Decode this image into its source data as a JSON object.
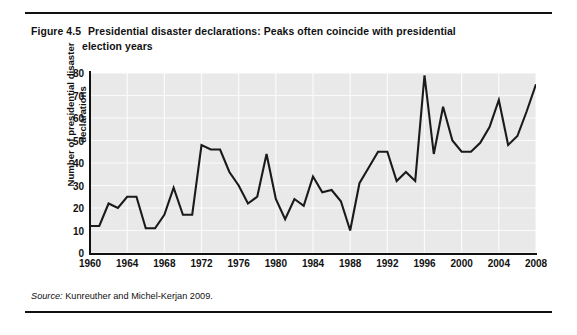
{
  "figure": {
    "number": "Figure 4.5",
    "title_line1": "Presidential disaster declarations: Peaks often coincide with presidential",
    "title_line2": "election years",
    "source_label": "Source:",
    "source_text": "Kunreuther and Michel-Kerjan 2009."
  },
  "chart_data": {
    "type": "line",
    "xlabel": "",
    "ylabel": "Number of presidential disaster declarations",
    "xlim": [
      1960,
      2008
    ],
    "ylim": [
      0,
      80
    ],
    "yticks": [
      0,
      10,
      20,
      30,
      40,
      50,
      60,
      70,
      80
    ],
    "xticks": [
      1960,
      1964,
      1968,
      1972,
      1976,
      1980,
      1984,
      1988,
      1992,
      1996,
      2000,
      2004,
      2008
    ],
    "grid": true,
    "legend": "none",
    "line_color": "#1a1a1a",
    "plot_background": "#e9e9e9",
    "x": [
      1960,
      1961,
      1962,
      1963,
      1964,
      1965,
      1966,
      1967,
      1968,
      1969,
      1970,
      1971,
      1972,
      1973,
      1974,
      1975,
      1976,
      1977,
      1978,
      1979,
      1980,
      1981,
      1982,
      1983,
      1984,
      1985,
      1986,
      1987,
      1988,
      1989,
      1990,
      1991,
      1992,
      1993,
      1994,
      1995,
      1996,
      1997,
      1998,
      1999,
      2000,
      2001,
      2002,
      2003,
      2004,
      2005,
      2006,
      2007,
      2008
    ],
    "values": [
      12,
      12,
      22,
      20,
      25,
      25,
      11,
      11,
      17,
      29,
      17,
      17,
      48,
      46,
      46,
      36,
      30,
      22,
      25,
      44,
      24,
      15,
      24,
      21,
      34,
      27,
      28,
      23,
      10,
      31,
      38,
      45,
      45,
      32,
      36,
      32,
      79,
      44,
      65,
      50,
      45,
      45,
      49,
      56,
      68,
      48,
      52,
      63,
      75
    ],
    "series": [
      {
        "name": "Number of presidential disaster declarations",
        "values": [
          12,
          12,
          22,
          20,
          25,
          25,
          11,
          11,
          17,
          29,
          17,
          17,
          48,
          46,
          46,
          36,
          30,
          22,
          25,
          44,
          24,
          15,
          24,
          21,
          34,
          27,
          28,
          23,
          10,
          31,
          38,
          45,
          45,
          32,
          36,
          32,
          79,
          44,
          65,
          50,
          45,
          45,
          49,
          56,
          68,
          48,
          52,
          63,
          75
        ]
      }
    ]
  }
}
